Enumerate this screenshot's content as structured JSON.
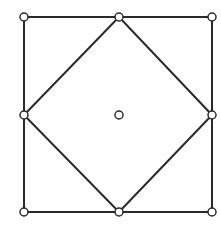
{
  "diagram": {
    "stroke_color": "#2a2a2a",
    "node_fill": "#ffffff",
    "node_radius": 4,
    "stroke_width": 2,
    "nodes": [
      {
        "id": "top-left",
        "x": 24,
        "y": 17
      },
      {
        "id": "top-middle",
        "x": 119,
        "y": 17
      },
      {
        "id": "top-right",
        "x": 212,
        "y": 17
      },
      {
        "id": "middle-left",
        "x": 24,
        "y": 115
      },
      {
        "id": "center",
        "x": 119,
        "y": 115
      },
      {
        "id": "middle-right",
        "x": 212,
        "y": 115
      },
      {
        "id": "bottom-left",
        "x": 24,
        "y": 212
      },
      {
        "id": "bottom-middle",
        "x": 119,
        "y": 212
      },
      {
        "id": "bottom-right",
        "x": 212,
        "y": 212
      }
    ],
    "edges": [
      {
        "from": "top-left",
        "to": "top-middle",
        "group": "outer-square"
      },
      {
        "from": "top-middle",
        "to": "top-right",
        "group": "outer-square"
      },
      {
        "from": "top-right",
        "to": "middle-right",
        "group": "outer-square"
      },
      {
        "from": "middle-right",
        "to": "bottom-right",
        "group": "outer-square"
      },
      {
        "from": "bottom-right",
        "to": "bottom-middle",
        "group": "outer-square"
      },
      {
        "from": "bottom-middle",
        "to": "bottom-left",
        "group": "outer-square"
      },
      {
        "from": "bottom-left",
        "to": "middle-left",
        "group": "outer-square"
      },
      {
        "from": "middle-left",
        "to": "top-left",
        "group": "outer-square"
      },
      {
        "from": "top-middle",
        "to": "middle-right",
        "group": "inner-diamond"
      },
      {
        "from": "middle-right",
        "to": "bottom-middle",
        "group": "inner-diamond"
      },
      {
        "from": "bottom-middle",
        "to": "middle-left",
        "group": "inner-diamond"
      },
      {
        "from": "middle-left",
        "to": "top-middle",
        "group": "inner-diamond"
      }
    ]
  }
}
